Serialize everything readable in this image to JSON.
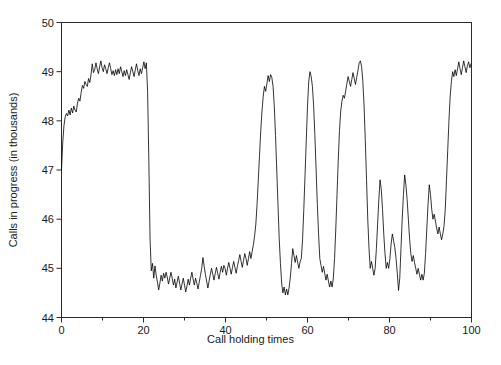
{
  "chart_data": {
    "type": "line",
    "title": "",
    "xlabel": "Call holding times",
    "ylabel": "Calls in progress (in thousands)",
    "xlim": [
      0,
      100
    ],
    "ylim": [
      44,
      50
    ],
    "xticks": [
      0,
      20,
      40,
      60,
      80,
      100
    ],
    "xtick_labels": [
      "0",
      "20",
      "40",
      "60",
      "80",
      "100"
    ],
    "xminor_ticks": [
      10,
      30,
      50,
      70,
      90
    ],
    "yticks": [
      44,
      45,
      46,
      47,
      48,
      49,
      50
    ],
    "ytick_labels": [
      "44",
      "45",
      "46",
      "47",
      "48",
      "49",
      "50"
    ],
    "grid": false,
    "legend": null,
    "line_color": "#000000",
    "line_width": 0.8,
    "series": [
      {
        "name": "Calls in progress",
        "x": [
          0.0,
          0.3,
          0.6,
          0.9,
          1.2,
          1.5,
          1.8,
          2.1,
          2.4,
          2.7,
          3.0,
          3.3,
          3.6,
          3.9,
          4.2,
          4.5,
          4.8,
          5.1,
          5.4,
          5.7,
          6.0,
          6.3,
          6.6,
          6.9,
          7.2,
          7.5,
          7.8,
          8.1,
          8.4,
          8.7,
          9.0,
          9.3,
          9.6,
          9.9,
          10.2,
          10.5,
          10.8,
          11.1,
          11.4,
          11.7,
          12.0,
          12.3,
          12.6,
          12.9,
          13.2,
          13.5,
          13.8,
          14.1,
          14.4,
          14.7,
          15.0,
          15.3,
          15.6,
          15.9,
          16.2,
          16.5,
          16.8,
          17.1,
          17.4,
          17.7,
          18.0,
          18.3,
          18.6,
          18.9,
          19.2,
          19.5,
          19.8,
          20.1,
          20.4,
          20.7,
          21.0,
          21.3,
          21.6,
          21.9,
          22.2,
          22.5,
          22.8,
          23.1,
          23.4,
          23.7,
          24.0,
          24.3,
          24.6,
          24.9,
          25.2,
          25.5,
          25.8,
          26.1,
          26.4,
          26.7,
          27.0,
          27.3,
          27.6,
          27.9,
          28.2,
          28.5,
          28.8,
          29.1,
          29.4,
          29.7,
          30.0,
          30.3,
          30.6,
          30.9,
          31.2,
          31.5,
          31.8,
          32.1,
          32.4,
          32.7,
          33.0,
          33.3,
          33.6,
          33.9,
          34.2,
          34.5,
          34.8,
          35.1,
          35.4,
          35.7,
          36.0,
          36.3,
          36.6,
          36.9,
          37.2,
          37.5,
          37.8,
          38.1,
          38.4,
          38.7,
          39.0,
          39.3,
          39.6,
          39.9,
          40.2,
          40.5,
          40.8,
          41.1,
          41.4,
          41.7,
          42.0,
          42.3,
          42.6,
          42.9,
          43.2,
          43.5,
          43.8,
          44.1,
          44.4,
          44.7,
          45.0,
          45.3,
          45.6,
          45.9,
          46.2,
          46.5,
          46.8,
          47.1,
          47.4,
          47.7,
          48.0,
          48.3,
          48.6,
          48.9,
          49.2,
          49.5,
          49.8,
          50.1,
          50.4,
          50.7,
          51.0,
          51.3,
          51.6,
          51.9,
          52.2,
          52.5,
          52.8,
          53.1,
          53.4,
          53.7,
          54.0,
          54.3,
          54.6,
          54.9,
          55.2,
          55.5,
          55.8,
          56.1,
          56.4,
          56.7,
          57.0,
          57.3,
          57.6,
          57.9,
          58.2,
          58.5,
          58.8,
          59.1,
          59.4,
          59.7,
          60.0,
          60.3,
          60.6,
          60.9,
          61.2,
          61.5,
          61.8,
          62.1,
          62.4,
          62.7,
          63.0,
          63.3,
          63.6,
          63.9,
          64.2,
          64.5,
          64.8,
          65.1,
          65.4,
          65.7,
          66.0,
          66.3,
          66.6,
          66.9,
          67.2,
          67.5,
          67.8,
          68.1,
          68.4,
          68.7,
          69.0,
          69.3,
          69.6,
          69.9,
          70.2,
          70.5,
          70.8,
          71.1,
          71.4,
          71.7,
          72.0,
          72.3,
          72.6,
          72.9,
          73.2,
          73.5,
          73.8,
          74.1,
          74.4,
          74.7,
          75.0,
          75.3,
          75.6,
          75.9,
          76.2,
          76.5,
          76.8,
          77.1,
          77.4,
          77.7,
          78.0,
          78.3,
          78.6,
          78.9,
          79.2,
          79.5,
          79.8,
          80.1,
          80.4,
          80.7,
          81.0,
          81.3,
          81.6,
          81.9,
          82.2,
          82.5,
          82.8,
          83.1,
          83.4,
          83.7,
          84.0,
          84.3,
          84.6,
          84.9,
          85.2,
          85.5,
          85.8,
          86.1,
          86.4,
          86.7,
          87.0,
          87.3,
          87.6,
          87.9,
          88.2,
          88.5,
          88.8,
          89.1,
          89.4,
          89.7,
          90.0,
          90.3,
          90.6,
          90.9,
          91.2,
          91.5,
          91.8,
          92.1,
          92.4,
          92.7,
          93.0,
          93.3,
          93.6,
          93.9,
          94.2,
          94.5,
          94.8,
          95.1,
          95.4,
          95.7,
          96.0,
          96.3,
          96.6,
          96.9,
          97.2,
          97.5,
          97.8,
          98.1,
          98.4,
          98.7,
          99.0,
          99.3,
          99.6,
          99.9
        ],
        "y": [
          47.0,
          47.55,
          47.9,
          48.08,
          48.15,
          48.1,
          48.22,
          48.12,
          48.26,
          48.16,
          48.3,
          48.22,
          48.18,
          48.36,
          48.46,
          48.4,
          48.58,
          48.72,
          48.66,
          48.8,
          48.74,
          48.7,
          48.86,
          48.78,
          48.94,
          49.16,
          48.98,
          49.04,
          49.18,
          49.06,
          48.96,
          49.1,
          49.22,
          49.08,
          49.0,
          49.14,
          49.06,
          48.96,
          49.08,
          49.18,
          49.06,
          48.94,
          49.02,
          48.92,
          49.04,
          48.94,
          49.06,
          48.96,
          49.1,
          49.0,
          48.9,
          49.02,
          48.92,
          49.04,
          48.94,
          48.84,
          48.98,
          49.1,
          49.0,
          48.9,
          49.04,
          49.16,
          49.02,
          48.92,
          49.06,
          48.96,
          49.08,
          49.2,
          49.06,
          49.18,
          48.6,
          47.2,
          45.6,
          44.95,
          45.1,
          44.8,
          45.05,
          44.86,
          44.72,
          44.56,
          44.7,
          44.86,
          44.74,
          44.9,
          44.8,
          44.92,
          44.82,
          44.68,
          44.8,
          44.92,
          44.8,
          44.66,
          44.78,
          44.6,
          44.72,
          44.84,
          44.7,
          44.56,
          44.68,
          44.8,
          44.66,
          44.52,
          44.64,
          44.78,
          44.66,
          44.8,
          44.92,
          44.78,
          44.66,
          44.8,
          44.7,
          44.58,
          44.72,
          44.86,
          45.0,
          45.22,
          45.04,
          44.88,
          44.74,
          44.6,
          44.74,
          44.88,
          45.0,
          44.88,
          44.76,
          44.9,
          45.02,
          44.9,
          44.78,
          44.92,
          45.04,
          44.92,
          45.06,
          45.0,
          44.86,
          45.0,
          45.12,
          45.0,
          44.88,
          45.02,
          45.14,
          45.02,
          44.9,
          45.04,
          45.16,
          45.28,
          45.14,
          45.02,
          45.16,
          45.3,
          45.2,
          45.06,
          45.2,
          45.34,
          45.2,
          45.34,
          45.48,
          45.66,
          45.9,
          46.3,
          46.8,
          47.3,
          47.8,
          48.2,
          48.5,
          48.7,
          48.6,
          48.76,
          48.92,
          48.8,
          48.94,
          48.88,
          48.7,
          48.3,
          47.7,
          47.0,
          46.3,
          45.6,
          45.1,
          44.7,
          44.5,
          44.62,
          44.46,
          44.58,
          44.46,
          44.6,
          44.8,
          45.1,
          45.4,
          45.26,
          45.12,
          45.26,
          45.12,
          45.0,
          45.14,
          45.2,
          45.6,
          46.2,
          46.9,
          47.6,
          48.3,
          48.8,
          49.0,
          48.9,
          48.7,
          48.3,
          47.7,
          47.0,
          46.3,
          45.7,
          45.2,
          45.06,
          44.92,
          45.04,
          44.9,
          44.76,
          44.88,
          44.74,
          44.62,
          44.74,
          44.62,
          44.8,
          45.2,
          45.8,
          46.5,
          47.2,
          47.8,
          48.2,
          48.4,
          48.52,
          48.46,
          48.6,
          48.76,
          48.9,
          48.8,
          48.7,
          48.84,
          48.98,
          48.86,
          48.74,
          48.88,
          49.02,
          49.18,
          49.22,
          49.1,
          48.8,
          48.3,
          47.6,
          46.8,
          46.0,
          45.4,
          45.0,
          45.14,
          45.0,
          44.86,
          45.0,
          45.4,
          45.9,
          46.4,
          46.8,
          46.6,
          46.2,
          45.7,
          45.3,
          45.0,
          45.12,
          45.0,
          45.2,
          45.5,
          45.7,
          45.56,
          45.42,
          45.2,
          44.9,
          44.55,
          44.8,
          45.4,
          46.0,
          46.5,
          46.9,
          46.7,
          46.4,
          46.0,
          45.6,
          45.3,
          45.14,
          45.26,
          45.12,
          45.0,
          44.88,
          45.0,
          44.88,
          44.76,
          44.88,
          44.76,
          44.9,
          45.3,
          45.8,
          46.3,
          46.7,
          46.5,
          46.2,
          46.0,
          46.1,
          45.96,
          45.82,
          45.7,
          45.84,
          45.7,
          45.58,
          45.7,
          45.86,
          46.2,
          46.8,
          47.4,
          48.0,
          48.5,
          48.8,
          49.0,
          48.9,
          49.04,
          48.92,
          49.06,
          49.2,
          49.06,
          48.94,
          49.08,
          49.22,
          49.1,
          48.98,
          49.12,
          49.2,
          49.08,
          49.16
        ]
      }
    ]
  },
  "axes": {
    "ylabel_text": "Calls in progress (in thousands)",
    "xlabel_text": "Call holding times"
  }
}
